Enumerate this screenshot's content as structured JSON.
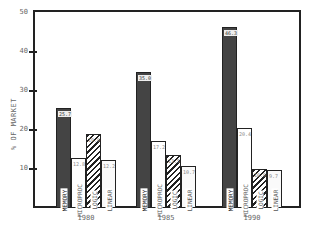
{
  "chart_data": {
    "type": "bar",
    "title": "",
    "xlabel": "",
    "ylabel": "% OF MARKET",
    "ylim": [
      0,
      50
    ],
    "yticks": [
      10,
      20,
      30,
      40,
      50
    ],
    "grid": false,
    "legend": "in-bar labels",
    "categories": [
      "1980",
      "1985",
      "1990"
    ],
    "series": [
      {
        "name": "MEMORY",
        "values": [
          25.7,
          35.0,
          46.3
        ]
      },
      {
        "name": "MICROPROC",
        "values": [
          12.8,
          17.2,
          20.4
        ]
      },
      {
        "name": "LOGIC",
        "values": [
          19.0,
          13.5,
          10.0
        ]
      },
      {
        "name": "LINEAR",
        "values": [
          12.2,
          10.7,
          9.7
        ]
      }
    ]
  }
}
